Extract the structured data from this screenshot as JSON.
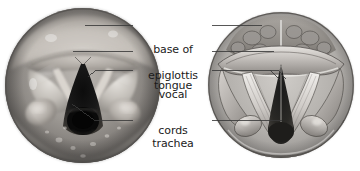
{
  "figure": {
    "background_color": "#ffffff",
    "text_color": "#1b1b1b",
    "leader_line_color": "#3a3a3a"
  },
  "panels": {
    "left": {
      "name": "endoscopic-photograph",
      "description": "Grayscale laryngoscopic photograph of the larynx viewed from above",
      "shape": "circle",
      "tone": "grayscale"
    },
    "right": {
      "name": "anatomical-illustration",
      "description": "Grayscale line-and-shade drawing of the larynx viewed from above",
      "shape": "circle",
      "tone": "grayscale"
    }
  },
  "labels": [
    {
      "id": "base-of-tongue",
      "line1": "base of",
      "line2": "tongue",
      "full_text": "base of tongue"
    },
    {
      "id": "epiglottis",
      "line1": "epiglottis",
      "line2": "",
      "full_text": "epiglottis"
    },
    {
      "id": "vocal-cords",
      "line1": "vocal",
      "line2": "cords",
      "full_text": "vocal cords"
    },
    {
      "id": "trachea",
      "line1": "trachea",
      "line2": "",
      "full_text": "trachea"
    }
  ]
}
